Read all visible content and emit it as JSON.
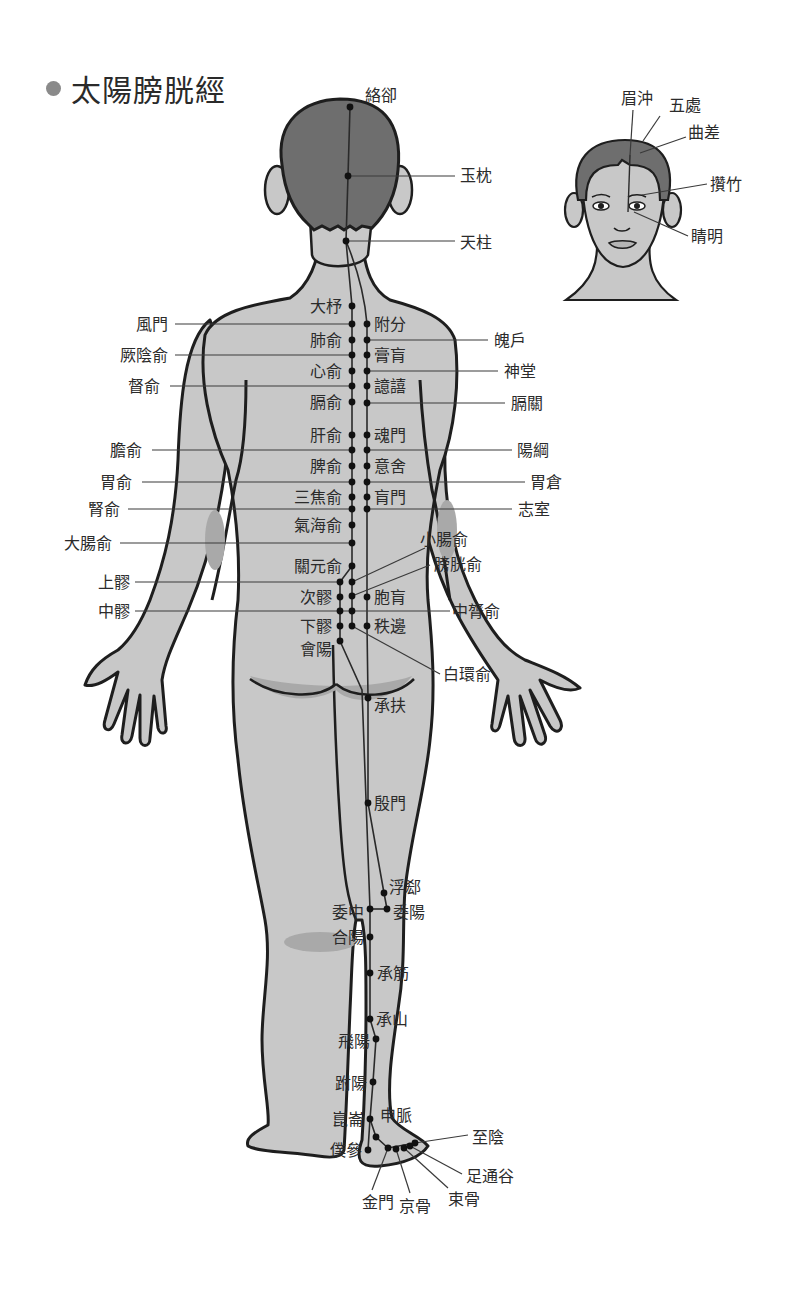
{
  "title": "太陽膀胱經",
  "colors": {
    "skin": "#c8c8c8",
    "hair": "#6e6e6e",
    "shade": "#a9a9a9",
    "outline": "#1e1e1e",
    "line": "#3a3a3a",
    "point": "#111111",
    "title_dot": "#8a8a8a"
  },
  "head_inset": {
    "labels": [
      {
        "text": "眉沖",
        "x": 621,
        "y": 104,
        "lx1": 633,
        "ly1": 110,
        "lx2": 630,
        "ly2": 155
      },
      {
        "text": "五處",
        "x": 669,
        "y": 111,
        "lx1": 660,
        "ly1": 116,
        "lx2": 643,
        "ly2": 141
      },
      {
        "text": "曲差",
        "x": 688,
        "y": 138,
        "lx1": 686,
        "ly1": 137,
        "lx2": 640,
        "ly2": 153
      },
      {
        "text": "攢竹",
        "x": 710,
        "y": 190,
        "lx1": 707,
        "ly1": 184,
        "lx2": 642,
        "ly2": 195
      },
      {
        "text": "睛明",
        "x": 691,
        "y": 242,
        "lx1": 688,
        "ly1": 236,
        "lx2": 634,
        "ly2": 212
      }
    ]
  },
  "back_view": {
    "points": [
      {
        "name": "絡卻",
        "px": 350,
        "py": 107,
        "tx": 365,
        "ty": 101,
        "anchor": "start",
        "line": null
      },
      {
        "name": "玉枕",
        "px": 348,
        "py": 176,
        "tx": 460,
        "ty": 181,
        "anchor": "start",
        "line": [
          348,
          176,
          455,
          176
        ]
      },
      {
        "name": "天柱",
        "px": 346,
        "py": 241,
        "tx": 460,
        "ty": 248,
        "anchor": "start",
        "line": [
          346,
          241,
          455,
          241
        ]
      },
      {
        "name": "大杼",
        "px": 352,
        "py": 306,
        "tx": 342,
        "ty": 312,
        "anchor": "end",
        "line": null
      },
      {
        "name": "風門",
        "px": 352,
        "py": 324,
        "tx": 168,
        "ty": 330,
        "anchor": "end",
        "line": [
          175,
          324,
          352,
          324
        ]
      },
      {
        "name": "肺俞",
        "px": 352,
        "py": 340,
        "tx": 342,
        "ty": 346,
        "anchor": "end",
        "line": null
      },
      {
        "name": "厥陰俞",
        "px": 352,
        "py": 355,
        "tx": 168,
        "ty": 361,
        "anchor": "end",
        "line": [
          175,
          355,
          352,
          355
        ]
      },
      {
        "name": "心俞",
        "px": 352,
        "py": 371,
        "tx": 342,
        "ty": 377,
        "anchor": "end",
        "line": null
      },
      {
        "name": "督俞",
        "px": 352,
        "py": 386,
        "tx": 160,
        "ty": 392,
        "anchor": "end",
        "line": [
          170,
          386,
          352,
          386
        ]
      },
      {
        "name": "膈俞",
        "px": 352,
        "py": 402,
        "tx": 342,
        "ty": 408,
        "anchor": "end",
        "line": null
      },
      {
        "name": "肝俞",
        "px": 352,
        "py": 435,
        "tx": 342,
        "ty": 441,
        "anchor": "end",
        "line": null
      },
      {
        "name": "膽俞",
        "px": 352,
        "py": 450,
        "tx": 142,
        "ty": 456,
        "anchor": "end",
        "line": [
          152,
          450,
          352,
          450
        ]
      },
      {
        "name": "脾俞",
        "px": 352,
        "py": 466,
        "tx": 342,
        "ty": 472,
        "anchor": "end",
        "line": null
      },
      {
        "name": "胃俞",
        "px": 352,
        "py": 482,
        "tx": 132,
        "ty": 488,
        "anchor": "end",
        "line": [
          142,
          482,
          352,
          482
        ]
      },
      {
        "name": "三焦俞",
        "px": 352,
        "py": 497,
        "tx": 342,
        "ty": 503,
        "anchor": "end",
        "line": null
      },
      {
        "name": "腎俞",
        "px": 352,
        "py": 509,
        "tx": 120,
        "ty": 515,
        "anchor": "end",
        "line": [
          128,
          509,
          352,
          509
        ]
      },
      {
        "name": "氣海俞",
        "px": 352,
        "py": 525,
        "tx": 342,
        "ty": 531,
        "anchor": "end",
        "line": null
      },
      {
        "name": "大腸俞",
        "px": 352,
        "py": 543,
        "tx": 112,
        "ty": 549,
        "anchor": "end",
        "line": [
          120,
          543,
          352,
          543
        ]
      },
      {
        "name": "關元俞",
        "px": 352,
        "py": 566,
        "tx": 342,
        "ty": 572,
        "anchor": "end",
        "line": null
      },
      {
        "name": "上髎",
        "px": 340,
        "py": 582,
        "tx": 130,
        "ty": 588,
        "anchor": "end",
        "line": [
          135,
          582,
          340,
          582
        ]
      },
      {
        "name": "次髎",
        "px": 340,
        "py": 597,
        "tx": 332,
        "ty": 603,
        "anchor": "end",
        "line": null
      },
      {
        "name": "中髎",
        "px": 340,
        "py": 611,
        "tx": 130,
        "ty": 617,
        "anchor": "end",
        "line": [
          135,
          611,
          340,
          611
        ]
      },
      {
        "name": "下髎",
        "px": 340,
        "py": 626,
        "tx": 332,
        "ty": 632,
        "anchor": "end",
        "line": null
      },
      {
        "name": "會陽",
        "px": 340,
        "py": 641,
        "tx": 332,
        "ty": 655,
        "anchor": "end",
        "line": null
      },
      {
        "name": "附分",
        "px": 367,
        "py": 324,
        "tx": 374,
        "ty": 330,
        "anchor": "start",
        "line": null
      },
      {
        "name": "魄戶",
        "px": 367,
        "py": 340,
        "tx": 494,
        "ty": 346,
        "anchor": "start",
        "line": [
          367,
          340,
          488,
          340
        ]
      },
      {
        "name": "膏肓",
        "px": 367,
        "py": 355,
        "tx": 374,
        "ty": 361,
        "anchor": "start",
        "line": null
      },
      {
        "name": "神堂",
        "px": 367,
        "py": 371,
        "tx": 504,
        "ty": 377,
        "anchor": "start",
        "line": [
          367,
          371,
          498,
          371
        ]
      },
      {
        "name": "譩譆",
        "px": 367,
        "py": 386,
        "tx": 374,
        "ty": 392,
        "anchor": "start",
        "line": null
      },
      {
        "name": "膈關",
        "px": 367,
        "py": 403,
        "tx": 511,
        "ty": 409,
        "anchor": "start",
        "line": [
          367,
          403,
          505,
          403
        ]
      },
      {
        "name": "魂門",
        "px": 367,
        "py": 435,
        "tx": 374,
        "ty": 441,
        "anchor": "start",
        "line": null
      },
      {
        "name": "陽綱",
        "px": 367,
        "py": 450,
        "tx": 517,
        "ty": 456,
        "anchor": "start",
        "line": [
          367,
          450,
          512,
          450
        ]
      },
      {
        "name": "意舍",
        "px": 367,
        "py": 466,
        "tx": 374,
        "ty": 472,
        "anchor": "start",
        "line": null
      },
      {
        "name": "胃倉",
        "px": 367,
        "py": 482,
        "tx": 530,
        "ty": 488,
        "anchor": "start",
        "line": [
          367,
          482,
          525,
          482
        ]
      },
      {
        "name": "肓門",
        "px": 367,
        "py": 497,
        "tx": 374,
        "ty": 503,
        "anchor": "start",
        "line": null
      },
      {
        "name": "志室",
        "px": 367,
        "py": 509,
        "tx": 518,
        "ty": 515,
        "anchor": "start",
        "line": [
          367,
          509,
          512,
          509
        ]
      },
      {
        "name": "小腸俞",
        "px": 352,
        "py": 582,
        "tx": 420,
        "ty": 545,
        "anchor": "start",
        "line": [
          352,
          582,
          425,
          548
        ]
      },
      {
        "name": "膀胱俞",
        "px": 352,
        "py": 596,
        "tx": 434,
        "ty": 570,
        "anchor": "start",
        "line": [
          352,
          596,
          430,
          565
        ]
      },
      {
        "name": "胞肓",
        "px": 367,
        "py": 597,
        "tx": 374,
        "ty": 603,
        "anchor": "start",
        "line": null
      },
      {
        "name": "中膂俞",
        "px": 352,
        "py": 611,
        "tx": 452,
        "ty": 617,
        "anchor": "start",
        "line": [
          340,
          611,
          450,
          611
        ]
      },
      {
        "name": "秩邊",
        "px": 367,
        "py": 626,
        "tx": 374,
        "ty": 632,
        "anchor": "start",
        "line": null
      },
      {
        "name": "白環俞",
        "px": 352,
        "py": 626,
        "tx": 443,
        "ty": 680,
        "anchor": "start",
        "line": [
          352,
          626,
          440,
          674
        ]
      },
      {
        "name": "承扶",
        "px": 368,
        "py": 698,
        "tx": 374,
        "ty": 711,
        "anchor": "start",
        "line": null
      },
      {
        "name": "殷門",
        "px": 368,
        "py": 803,
        "tx": 374,
        "ty": 809,
        "anchor": "start",
        "line": null
      },
      {
        "name": "浮郄",
        "px": 384,
        "py": 893,
        "tx": 389,
        "ty": 893,
        "anchor": "start",
        "line": null
      },
      {
        "name": "委陽",
        "px": 387,
        "py": 909,
        "tx": 393,
        "ty": 918,
        "anchor": "start",
        "line": null
      },
      {
        "name": "委中",
        "px": 370,
        "py": 909,
        "tx": 364,
        "ty": 918,
        "anchor": "end",
        "line": null
      },
      {
        "name": "合陽",
        "px": 370,
        "py": 937,
        "tx": 364,
        "ty": 943,
        "anchor": "end",
        "line": null
      },
      {
        "name": "承筋",
        "px": 370,
        "py": 973,
        "tx": 377,
        "ty": 979,
        "anchor": "start",
        "line": null
      },
      {
        "name": "承山",
        "px": 370,
        "py": 1019,
        "tx": 376,
        "ty": 1025,
        "anchor": "start",
        "line": null
      },
      {
        "name": "飛陽",
        "px": 376,
        "py": 1039,
        "tx": 370,
        "ty": 1047,
        "anchor": "end",
        "line": null
      },
      {
        "name": "跗陽",
        "px": 373,
        "py": 1082,
        "tx": 367,
        "ty": 1089,
        "anchor": "end",
        "line": null
      },
      {
        "name": "崑崙",
        "px": 370,
        "py": 1119,
        "tx": 364,
        "ty": 1125,
        "anchor": "end",
        "line": null
      },
      {
        "name": "申脈",
        "px": 376,
        "py": 1137,
        "tx": 380,
        "ty": 1121,
        "anchor": "start",
        "line": null
      },
      {
        "name": "僕參",
        "px": 368,
        "py": 1150,
        "tx": 362,
        "ty": 1156,
        "anchor": "end",
        "line": null
      },
      {
        "name": "金門",
        "px": 388,
        "py": 1148,
        "tx": 362,
        "ty": 1208,
        "anchor": "start",
        "line": [
          388,
          1148,
          372,
          1190
        ]
      },
      {
        "name": "京骨",
        "px": 396,
        "py": 1149,
        "tx": 399,
        "ty": 1212,
        "anchor": "start",
        "line": [
          396,
          1149,
          410,
          1193
        ]
      },
      {
        "name": "束骨",
        "px": 404,
        "py": 1148,
        "tx": 448,
        "ty": 1205,
        "anchor": "start",
        "line": [
          404,
          1148,
          448,
          1188
        ]
      },
      {
        "name": "足通谷",
        "px": 410,
        "py": 1146,
        "tx": 466,
        "ty": 1182,
        "anchor": "start",
        "line": [
          410,
          1146,
          462,
          1174
        ]
      },
      {
        "name": "至陰",
        "px": 415,
        "py": 1143,
        "tx": 472,
        "ty": 1143,
        "anchor": "start",
        "line": [
          415,
          1143,
          468,
          1135
        ]
      }
    ]
  }
}
